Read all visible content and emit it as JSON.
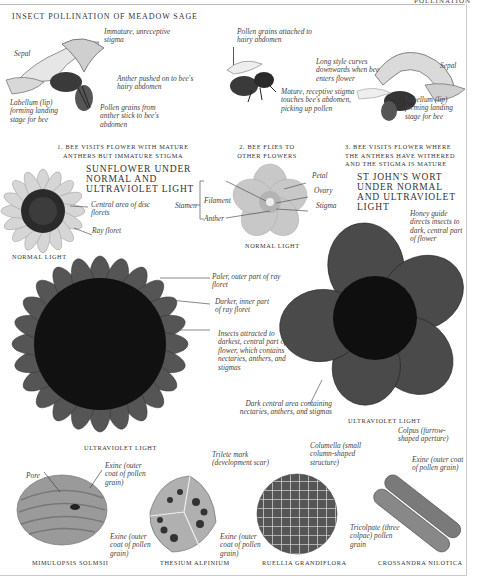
{
  "page": {
    "running_head": "POLLINATION",
    "section_title": "INSECT POLLINATION OF MEADOW SAGE"
  },
  "sage": {
    "panel1": {
      "caption": "1. BEE VISITS FLOWER WITH MATURE ANTHERS BUT IMMATURE STIGMA",
      "labels": {
        "sepal": "Sepal",
        "stigma": "Immature, unreceptive stigma",
        "anther": "Anther pushed on to bee's hairy abdomen",
        "labellum": "Labellum (lip) forming landing stage for bee",
        "pollen": "Pollen grains from anther stick to bee's abdomen"
      }
    },
    "panel2": {
      "caption": "2. BEE FLIES TO OTHER FLOWERS",
      "labels": {
        "pollen": "Pollen grains attached to hairy abdomen"
      }
    },
    "panel3": {
      "caption": "3. BEE VISITS FLOWER WHERE THE ANTHERS HAVE WITHERED AND THE STIGMA IS MATURE",
      "labels": {
        "style": "Long style curves downwards when bee enters flower",
        "sepal": "Sepal",
        "stigma": "Mature, receptive stigma touches bee's abdomen, picking up pollen",
        "labellum": "Labellum (lip) forming landing stage for bee"
      }
    }
  },
  "sunflower": {
    "heading": "SUNFLOWER UNDER NORMAL AND ULTRAVIOLET LIGHT",
    "normal_caption": "NORMAL LIGHT",
    "uv_caption": "ULTRAVIOLET LIGHT",
    "labels": {
      "disc": "Central area of disc florets",
      "ray": "Ray floret",
      "paler": "Paler, outer part of ray floret",
      "darker": "Darker, inner part of ray floret",
      "insects": "Insects attracted to darkest, central part of flower, which contains nectaries, anthers, and stigmas"
    }
  },
  "stjohns": {
    "heading": "ST JOHN'S WORT UNDER NORMAL AND ULTRAVIOLET LIGHT",
    "normal_caption": "NORMAL LIGHT",
    "uv_caption": "ULTRAVIOLET LIGHT",
    "labels": {
      "petal": "Petal",
      "ovary": "Ovary",
      "stigma": "Stigma",
      "stamen": "Stamen",
      "filament": "Filament",
      "anther": "Anther",
      "honey_guide": "Honey guide directs insects to dark, central part of flower",
      "dark_center": "Dark central area containing nectaries, anthers, and stigmas"
    }
  },
  "pollen_grains": [
    {
      "name": "MIMULOPSIS SOLMSII",
      "labels": [
        "Pore",
        "Exine (outer coat of pollen grain)"
      ]
    },
    {
      "name": "THESIUM ALPINIUM",
      "labels": [
        "Trilete mark (development scar)",
        "Exine (outer coat of pollen grain)"
      ]
    },
    {
      "name": "RUELLIA GRANDIFLORA",
      "labels": [
        "Columella (small column-shaped structure)",
        "Exine (outer coat of pollen grain)"
      ]
    },
    {
      "name": "CROSSANDRA NILOTICA",
      "labels": [
        "Colpus (furrow-shaped aperture)",
        "Exine (outer coat of pollen grain)",
        "Tricolpate (three colpae) pollen grain"
      ]
    }
  ],
  "colors": {
    "ink": "#333333",
    "sunflower_petal": "#d9d9d9",
    "sunflower_disc": "#2a2a2a",
    "uv_dark": "#111111",
    "rule": "#bbbbbb"
  }
}
